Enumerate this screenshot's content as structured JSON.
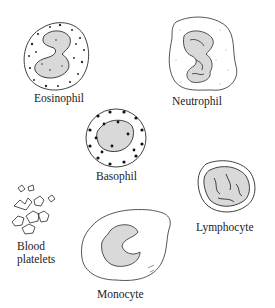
{
  "figure": {
    "type": "illustration",
    "colors": {
      "ink": "#2a2a2a",
      "nucleus_fill": "#d9d9d9",
      "background": "#ffffff"
    }
  },
  "cells": [
    {
      "id": "eosinophil",
      "label": "Eosinophil"
    },
    {
      "id": "neutrophil",
      "label": "Neutrophil"
    },
    {
      "id": "basophil",
      "label": "Basophil"
    },
    {
      "id": "blood-platelets",
      "label": "Blood\nplatelets"
    },
    {
      "id": "monocyte",
      "label": "Monocyte"
    },
    {
      "id": "lymphocyte",
      "label": "Lymphocyte"
    }
  ]
}
